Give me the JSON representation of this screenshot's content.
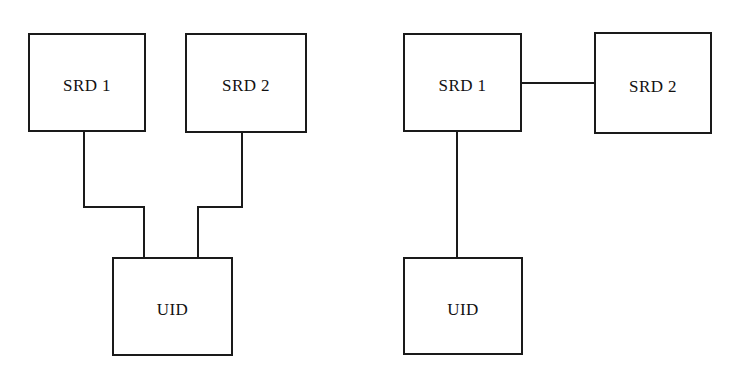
{
  "diagram": {
    "background_color": "#ffffff",
    "line_color": "#1a1a1a",
    "text_color": "#121212",
    "line_width": 2,
    "panels": [
      {
        "id": "left-topology",
        "name": "star-topology",
        "nodes": [
          {
            "id": "srd1",
            "label": "SRD 1",
            "x": 28,
            "y": 33,
            "w": 118,
            "h": 99
          },
          {
            "id": "srd2",
            "label": "SRD 2",
            "x": 185,
            "y": 33,
            "w": 122,
            "h": 100
          },
          {
            "id": "uid",
            "label": "UID",
            "x": 112,
            "y": 257,
            "w": 121,
            "h": 99
          }
        ],
        "connectors": [
          {
            "id": "srd1-to-uid",
            "from": "srd1",
            "to": "uid",
            "path": "M 84 132 L 84 207 L 144 207 L 144 258"
          },
          {
            "id": "srd2-to-uid",
            "from": "srd2",
            "to": "uid",
            "path": "M 242 133 L 242 207 L 198 207 L 198 258"
          }
        ]
      },
      {
        "id": "right-topology",
        "name": "chain-topology",
        "nodes": [
          {
            "id": "srd1",
            "label": "SRD 1",
            "x": 403,
            "y": 33,
            "w": 119,
            "h": 99
          },
          {
            "id": "srd2",
            "label": "SRD 2",
            "x": 594,
            "y": 32,
            "w": 118,
            "h": 102
          },
          {
            "id": "uid",
            "label": "UID",
            "x": 403,
            "y": 257,
            "w": 120,
            "h": 98
          }
        ],
        "connectors": [
          {
            "id": "srd1-to-srd2",
            "from": "srd1",
            "to": "srd2",
            "path": "M 521 83 L 595 83"
          },
          {
            "id": "srd1-to-uid",
            "from": "srd1",
            "to": "uid",
            "path": "M 457 131 L 457 258"
          }
        ]
      }
    ]
  }
}
